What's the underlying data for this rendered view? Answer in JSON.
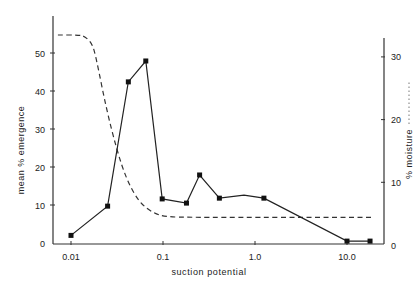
{
  "chart_data": {
    "type": "line",
    "title": "",
    "xlabel": "suction potential",
    "ylabel": "mean % emergence",
    "y2label": "% moisture",
    "xscale": "log",
    "xlim": [
      0.007,
      25
    ],
    "ylim": [
      0,
      58
    ],
    "y2lim": [
      0,
      34
    ],
    "x_ticks": [
      {
        "value": 0.01,
        "label": "0.01"
      },
      {
        "value": 0.1,
        "label": "0.1"
      },
      {
        "value": 1.0,
        "label": "1.0"
      },
      {
        "value": 10.0,
        "label": "10.0"
      }
    ],
    "y_ticks": [
      0,
      10,
      20,
      30,
      40,
      50
    ],
    "y2_ticks": [
      0,
      10,
      20,
      30
    ],
    "grid": false,
    "legend": "none (right axis label '% moisture' accompanied by dotted-line sample)",
    "series": [
      {
        "name": "mean % emergence",
        "axis": "left",
        "style": "solid",
        "marker": "square",
        "points": [
          {
            "x": 0.01,
            "y": 2,
            "marker": true
          },
          {
            "x": 0.025,
            "y": 9.7,
            "marker": true
          },
          {
            "x": 0.042,
            "y": 42.4,
            "marker": true
          },
          {
            "x": 0.065,
            "y": 47.9,
            "marker": true
          },
          {
            "x": 0.098,
            "y": 11.6,
            "marker": true
          },
          {
            "x": 0.18,
            "y": 10.5,
            "marker": true
          },
          {
            "x": 0.25,
            "y": 17.9,
            "marker": true
          },
          {
            "x": 0.41,
            "y": 11.8,
            "marker": true
          },
          {
            "x": 0.76,
            "y": 12.6,
            "marker": false
          },
          {
            "x": 1.25,
            "y": 11.8,
            "marker": true
          },
          {
            "x": 10.0,
            "y": 0.5,
            "marker": true
          },
          {
            "x": 17.8,
            "y": 0.5,
            "marker": true
          }
        ]
      },
      {
        "name": "% moisture",
        "axis": "right",
        "style": "dashed",
        "marker": "none",
        "points": [
          {
            "x": 0.0072,
            "y": 33.5
          },
          {
            "x": 0.012,
            "y": 33.5
          },
          {
            "x": 0.014,
            "y": 33.3
          },
          {
            "x": 0.017,
            "y": 32.2
          },
          {
            "x": 0.019,
            "y": 29.5
          },
          {
            "x": 0.024,
            "y": 22
          },
          {
            "x": 0.031,
            "y": 15.5
          },
          {
            "x": 0.04,
            "y": 10.5
          },
          {
            "x": 0.055,
            "y": 6.8
          },
          {
            "x": 0.08,
            "y": 5
          },
          {
            "x": 0.11,
            "y": 4.5
          },
          {
            "x": 0.2,
            "y": 4.4
          },
          {
            "x": 18.5,
            "y": 4.4
          }
        ]
      }
    ]
  }
}
